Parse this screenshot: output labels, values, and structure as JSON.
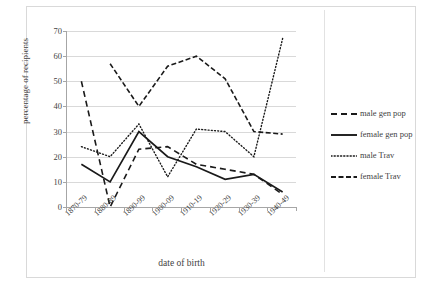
{
  "chart_data": {
    "type": "line",
    "title": "",
    "xlabel": "date of birth",
    "ylabel": "percentage of recipients",
    "categories": [
      "1870-79",
      "1880-89",
      "1890-99",
      "1900-09",
      "1910-19",
      "1920-29",
      "1930-39",
      "1940-49"
    ],
    "ylim": [
      0,
      70
    ],
    "yticks": [
      0,
      10,
      20,
      30,
      40,
      50,
      60,
      70
    ],
    "grid": true,
    "legend_position": "right",
    "series": [
      {
        "name": "male gen pop",
        "style": "dashed",
        "color": "#1a1a1a",
        "values": [
          50,
          0,
          23,
          24,
          17,
          15,
          13,
          5
        ]
      },
      {
        "name": "female gen pop",
        "style": "solid",
        "color": "#1a1a1a",
        "values": [
          17,
          10,
          30,
          20,
          16,
          11,
          13,
          6
        ]
      },
      {
        "name": "male Trav",
        "style": "dotted",
        "color": "#1a1a1a",
        "values": [
          24,
          20,
          33,
          12,
          31,
          30,
          20,
          67
        ]
      },
      {
        "name": "female Trav",
        "style": "dash-dot",
        "color": "#1a1a1a",
        "values": [
          null,
          57,
          40,
          56,
          60,
          51,
          30,
          29
        ]
      }
    ]
  },
  "legend": {
    "items": [
      {
        "label": "male gen pop",
        "style": "dashed"
      },
      {
        "label": "female gen pop",
        "style": "solid"
      },
      {
        "label": "male Trav",
        "style": "dotted"
      },
      {
        "label": "female Trav",
        "style": "dash-dot"
      }
    ]
  }
}
